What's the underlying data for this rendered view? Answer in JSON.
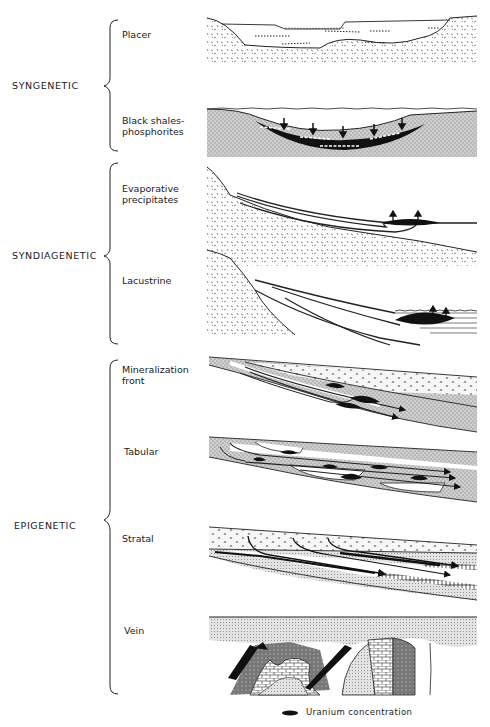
{
  "groups": [
    {
      "label": "SYNGENETIC",
      "types": [
        "Placer",
        "Black shales-\nphosphorites"
      ]
    },
    {
      "label": "SYNDIAGENETIC",
      "types": [
        "Evaporative\nprecipitates",
        "Lacustrine"
      ]
    },
    {
      "label": "EPIGENETIC",
      "types": [
        "Mineralization\nfront",
        "Tabular",
        "Stratal",
        "Vein"
      ]
    }
  ],
  "labels": {
    "syngenetic": "SYNGENETIC",
    "syndiagenetic": "SYNDIAGENETIC",
    "epigenetic": "EPIGENETIC",
    "placer": "Placer",
    "black_shales_1": "Black shales-",
    "black_shales_2": "phosphorites",
    "evaporative_1": "Evaporative",
    "evaporative_2": "precipitates",
    "lacustrine": "Lacustrine",
    "mineralization_1": "Mineralization",
    "mineralization_2": "front",
    "tabular": "Tabular",
    "stratal": "Stratal",
    "vein": "Vein"
  },
  "legend": {
    "symbol": "black-lens",
    "label": "Uranium concentration"
  }
}
